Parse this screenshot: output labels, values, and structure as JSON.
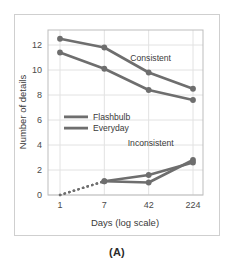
{
  "figure": {
    "caption": "(A)",
    "border_color": "#cfcfcf",
    "background": "#ffffff"
  },
  "chart_data": {
    "type": "line",
    "title": "",
    "xlabel": "Days (log scale)",
    "ylabel": "Number of details",
    "x_scale": "log",
    "categories": [
      "1",
      "7",
      "42",
      "224"
    ],
    "x_tick_labels": [
      "1",
      "7",
      "42",
      "224"
    ],
    "y_tick_labels": [
      "0",
      "2",
      "4",
      "6",
      "8",
      "10",
      "12"
    ],
    "y_ticks": [
      0,
      2,
      4,
      6,
      8,
      10,
      12
    ],
    "ylim": [
      0,
      13.2
    ],
    "grid": true,
    "grid_color": "#e2e2e2",
    "line_color": "#6e6e6e",
    "marker_color": "#6e6e6e",
    "legend_position": "inside-left-middle",
    "legend": [
      {
        "name": "Flashbulb",
        "color": "#6e6e6e"
      },
      {
        "name": "Everyday",
        "color": "#6e6e6e"
      }
    ],
    "annotations": [
      {
        "text": "Consistent",
        "x": 42,
        "y": 10.7
      },
      {
        "text": "Inconsistent",
        "x": 42,
        "y": 3.9
      }
    ],
    "series": [
      {
        "name": "Flashbulb",
        "group": "Consistent",
        "x": [
          "1",
          "7",
          "42",
          "224"
        ],
        "values": [
          12.5,
          11.8,
          9.8,
          8.5
        ]
      },
      {
        "name": "Everyday",
        "group": "Consistent",
        "x": [
          "1",
          "7",
          "42",
          "224"
        ],
        "values": [
          11.4,
          10.1,
          8.4,
          7.6
        ]
      },
      {
        "name": "Flashbulb",
        "group": "Inconsistent",
        "x": [
          "7",
          "42",
          "224"
        ],
        "values": [
          1.1,
          1.0,
          2.8
        ],
        "lead_in_dotted": {
          "from_x": "1",
          "from_y": 0.0,
          "to_x": "7",
          "to_y": 1.1
        }
      },
      {
        "name": "Everyday",
        "group": "Inconsistent",
        "x": [
          "7",
          "42",
          "224"
        ],
        "values": [
          1.1,
          1.6,
          2.6
        ],
        "lead_in_dotted": {
          "from_x": "1",
          "from_y": 0.0,
          "to_x": "7",
          "to_y": 1.1
        }
      }
    ]
  }
}
